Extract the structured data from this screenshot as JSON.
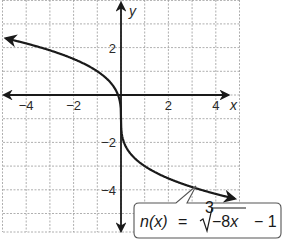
{
  "chart_data": {
    "type": "line",
    "title": "",
    "xlabel": "x",
    "ylabel": "y",
    "xlim": [
      -5,
      5
    ],
    "ylim": [
      -5.8,
      4
    ],
    "grid": true,
    "x_ticks": [
      {
        "value": -4,
        "label": "−4"
      },
      {
        "value": -2,
        "label": "−2"
      },
      {
        "value": 2,
        "label": "2"
      },
      {
        "value": 4,
        "label": "4"
      }
    ],
    "y_ticks": [
      {
        "value": 2,
        "label": "2"
      },
      {
        "value": -2,
        "label": "−2"
      },
      {
        "value": -4,
        "label": "−4"
      }
    ],
    "series": [
      {
        "name": "n(x) = cuberoot(-8x) - 1",
        "x": [
          -5,
          -4,
          -3,
          -2,
          -1,
          -0.5,
          -0.125,
          0,
          0.125,
          0.5,
          1,
          2,
          3,
          4,
          5
        ],
        "y": [
          2.42,
          2.17,
          1.88,
          1.52,
          1.0,
          0.59,
          0.0,
          -1.0,
          -2.0,
          -2.59,
          -3.0,
          -3.52,
          -3.88,
          -4.17,
          -4.42
        ]
      }
    ],
    "annotations": [
      {
        "text": "n(x) = ∛(−8x) − 1",
        "parts": {
          "fn": "n(x)",
          "eq": "=",
          "root_index": "3",
          "radicand_sign": "−",
          "radicand_coef": "8",
          "radicand_var": "x",
          "tail": "− 1"
        },
        "points_to": [
          3,
          -3.88
        ]
      }
    ]
  }
}
